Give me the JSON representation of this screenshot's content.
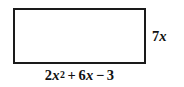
{
  "figure": {
    "type": "geometry-diagram",
    "shape": "rectangle",
    "background_color": "#ffffff",
    "stroke_color": "#1a1a1a",
    "text_color": "#111111",
    "labels": {
      "width_expression": "2x² + 6x − 3",
      "height_expression": "7x",
      "width_parts": {
        "term1_coefficient": "2",
        "term1_variable": "x",
        "term1_exponent": "2",
        "operator1": "+",
        "term2_coefficient": "6",
        "term2_variable": "x",
        "operator2": "−",
        "term3_constant": "3"
      },
      "height_parts": {
        "coefficient": "7",
        "variable": "x"
      }
    }
  }
}
